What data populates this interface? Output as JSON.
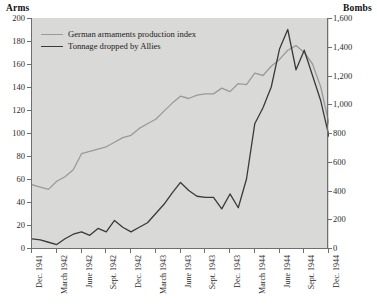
{
  "chart_data": {
    "type": "line",
    "title": "",
    "xlabel": "",
    "grid": false,
    "legend_position": "top-left",
    "left_axis": {
      "label": "Arms",
      "ylim": [
        0,
        200
      ],
      "ticks": [
        0,
        20,
        40,
        60,
        80,
        100,
        120,
        140,
        160,
        180,
        200
      ],
      "tick_labels": [
        "0",
        "20",
        "40",
        "60",
        "80",
        "100",
        "120",
        "140",
        "160",
        "180",
        "200"
      ]
    },
    "right_axis": {
      "label": "Bombs",
      "ylim": [
        0,
        1600
      ],
      "ticks": [
        0,
        200,
        400,
        600,
        800,
        1000,
        1200,
        1400,
        1600
      ],
      "tick_labels": [
        "0",
        "200",
        "400",
        "600",
        "800",
        "1,000",
        "1,200",
        "1,400",
        "1,600"
      ]
    },
    "x_tick_labels": [
      "Dec. 1941",
      "March 1942",
      "June 1942",
      "Sept. 1942",
      "Dec. 1942",
      "March 1943",
      "June 1943",
      "Sept. 1943",
      "Dec. 1943",
      "March 1944",
      "June 1944",
      "Sept. 1944",
      "Dec. 1944"
    ],
    "x_months": [
      "Dec. 1941",
      "Jan. 1942",
      "Feb. 1942",
      "March 1942",
      "April 1942",
      "May 1942",
      "June 1942",
      "July 1942",
      "Aug. 1942",
      "Sept. 1942",
      "Oct. 1942",
      "Nov. 1942",
      "Dec. 1942",
      "Jan. 1943",
      "Feb. 1943",
      "March 1943",
      "April 1943",
      "May 1943",
      "June 1943",
      "July 1943",
      "Aug. 1943",
      "Sept. 1943",
      "Oct. 1943",
      "Nov. 1943",
      "Dec. 1943",
      "Jan. 1944",
      "Feb. 1944",
      "March 1944",
      "April 1944",
      "May 1944",
      "June 1944",
      "July 1944",
      "Aug. 1944",
      "Sept. 1944",
      "Oct. 1944",
      "Nov. 1944",
      "Dec. 1944"
    ],
    "series": [
      {
        "name": "German armaments production index",
        "axis": "left",
        "color": "#9a9a9a",
        "values": [
          55,
          53,
          51,
          58,
          62,
          68,
          82,
          84,
          86,
          88,
          92,
          96,
          98,
          104,
          108,
          112,
          119,
          126,
          132,
          130,
          133,
          134,
          134,
          139,
          136,
          143,
          142,
          152,
          150,
          158,
          164,
          172,
          176,
          170,
          160,
          140,
          108
        ]
      },
      {
        "name": "Tonnage dropped by Allies",
        "axis": "right",
        "color": "#3a3a3a",
        "values_left_scale": [
          8,
          7,
          5,
          3,
          8,
          12,
          14,
          11,
          17,
          14,
          24,
          18,
          14,
          18,
          22,
          30,
          38,
          48,
          57,
          50,
          45,
          44,
          44,
          34,
          47,
          35,
          60,
          108,
          122,
          140,
          173,
          190,
          155,
          172,
          150,
          128,
          97
        ],
        "values_bombs": [
          64,
          56,
          40,
          24,
          64,
          96,
          112,
          88,
          136,
          112,
          192,
          144,
          112,
          144,
          176,
          240,
          304,
          384,
          456,
          400,
          360,
          352,
          352,
          272,
          376,
          280,
          480,
          864,
          976,
          1120,
          1384,
          1520,
          1240,
          1376,
          1200,
          1024,
          776
        ]
      }
    ]
  }
}
